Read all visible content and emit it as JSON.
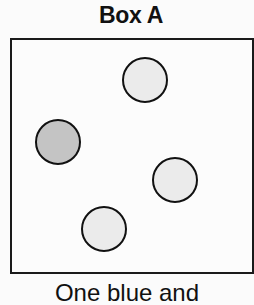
{
  "title": "Box A",
  "caption": "One blue and",
  "colors": {
    "border": "#1a1a1a",
    "circle_dark_fill": "#c4c4c4",
    "circle_light_fill": "#ebebeb",
    "circle_stroke": "#111111"
  },
  "circles": [
    {
      "id": "top",
      "cx": 145,
      "cy": 80,
      "r": 22,
      "shade": "light"
    },
    {
      "id": "left",
      "cx": 58,
      "cy": 142,
      "r": 22,
      "shade": "dark"
    },
    {
      "id": "right",
      "cx": 175,
      "cy": 180,
      "r": 22,
      "shade": "light"
    },
    {
      "id": "bottom",
      "cx": 104,
      "cy": 229,
      "r": 22,
      "shade": "light"
    }
  ]
}
